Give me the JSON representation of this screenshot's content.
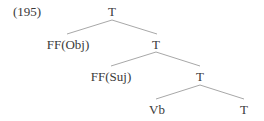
{
  "example": {
    "number": "(195)"
  },
  "tree": {
    "root": {
      "label": "T",
      "children": [
        {
          "label": "FF(Obj)"
        },
        {
          "label": "T",
          "children": [
            {
              "label": "FF(Suj)"
            },
            {
              "label": "T",
              "children": [
                {
                  "label": "Vb"
                },
                {
                  "label": "T"
                }
              ]
            }
          ]
        }
      ]
    },
    "nodes": {
      "t1": "T",
      "ff_obj": "FF(Obj)",
      "t2": "T",
      "ff_suj": "FF(Suj)",
      "t3": "T",
      "vb": "Vb",
      "t4": "T"
    }
  },
  "colors": {
    "text": "#3a3a3a",
    "edge": "#a8a8a8",
    "background": "#ffffff"
  }
}
